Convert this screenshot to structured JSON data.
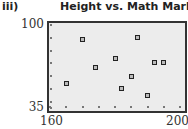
{
  "figure_label": "iii)",
  "chart_data": {
    "type": "scatter",
    "title": "Height vs. Math Mark",
    "xlabel": "",
    "ylabel": "",
    "xlim": [
      160,
      200
    ],
    "ylim": [
      35,
      100
    ],
    "x_tick_labels": [
      "160",
      "200"
    ],
    "y_tick_labels": [
      "100",
      "35"
    ],
    "x_minor_ticks": [
      160,
      165,
      170,
      175,
      180,
      185,
      190,
      195,
      200
    ],
    "y_minor_ticks": [
      35,
      40,
      50,
      60,
      70,
      80,
      90,
      100
    ],
    "grid": false,
    "legend": null,
    "series": [
      {
        "name": "Height vs. Math Mark",
        "marker": "square",
        "points": [
          {
            "x": 165,
            "y": 54
          },
          {
            "x": 170,
            "y": 89
          },
          {
            "x": 174,
            "y": 67
          },
          {
            "x": 180,
            "y": 74
          },
          {
            "x": 182,
            "y": 50
          },
          {
            "x": 185,
            "y": 60
          },
          {
            "x": 187,
            "y": 90
          },
          {
            "x": 190,
            "y": 45
          },
          {
            "x": 192,
            "y": 71
          },
          {
            "x": 195,
            "y": 71
          }
        ]
      }
    ]
  }
}
